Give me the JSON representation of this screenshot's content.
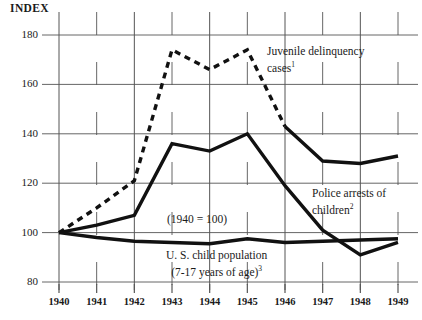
{
  "chart_data": {
    "type": "line",
    "title": "",
    "index_label": "INDEX",
    "base_note": "(1940 = 100)",
    "xlabel": "",
    "ylabel": "INDEX",
    "x": [
      1940,
      1941,
      1942,
      1943,
      1944,
      1945,
      1946,
      1947,
      1948,
      1949
    ],
    "categories": [
      "1940",
      "1941",
      "1942",
      "1943",
      "1944",
      "1945",
      "1946",
      "1947",
      "1948",
      "1949"
    ],
    "ylim": [
      80,
      180
    ],
    "yticks": [
      80,
      100,
      120,
      140,
      160,
      180
    ],
    "ytick_labels": [
      "80",
      "100",
      "120",
      "140",
      "160",
      "180"
    ],
    "grid": true,
    "legend_position": "inline-annotations",
    "series": [
      {
        "name": "Juvenile delinquency cases",
        "footnote": "1",
        "style": "dashed-then-solid",
        "dash_until_year": 1946,
        "values": [
          100,
          110,
          121,
          174,
          166,
          174,
          143,
          129,
          128,
          131
        ]
      },
      {
        "name": "Police arrests of children",
        "footnote": "2",
        "style": "solid-thick",
        "values": [
          100,
          103,
          107,
          136,
          133,
          140,
          119,
          101,
          91,
          96
        ]
      },
      {
        "name": "U. S. child population (7-17 years of age)",
        "footnote": "3",
        "style": "solid-thick",
        "values": [
          100,
          98,
          96.5,
          96,
          95.5,
          97.5,
          96,
          96.5,
          97,
          97.5
        ]
      }
    ]
  },
  "annotations": {
    "juvenile": {
      "line1": "Juvenile delinquency",
      "line2": "cases",
      "footnote": "1"
    },
    "police": {
      "line1": "Police arrests of",
      "line2": "children",
      "footnote": "2"
    },
    "population": {
      "line1": "U. S. child population",
      "line2": "(7-17 years of age)",
      "footnote": "3"
    },
    "base": "(1940 = 100)"
  },
  "colors": {
    "line": "#111111",
    "grid": "#555555",
    "background": "#ffffff",
    "text": "#1a1a1a"
  }
}
